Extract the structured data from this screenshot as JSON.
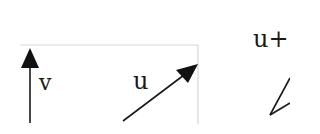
{
  "diagram": {
    "type": "vector-diagram",
    "vectors": [
      {
        "id": "v",
        "label": "v",
        "direction": "up"
      },
      {
        "id": "u",
        "label": "u",
        "direction": "up-right"
      },
      {
        "id": "sum",
        "label": "u+",
        "direction": "partial (clipped at right edge)"
      }
    ],
    "colors": {
      "stroke": "#1a1a1a",
      "frame": "#d0d0d0",
      "background": "#ffffff"
    }
  }
}
